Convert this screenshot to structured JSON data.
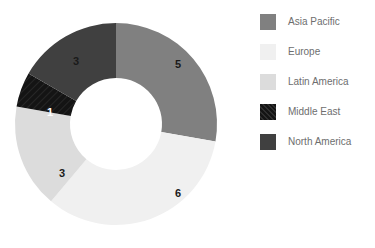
{
  "chart_data": {
    "type": "pie",
    "variant": "donut",
    "title": "",
    "xlabel": "",
    "ylabel": "",
    "total": 18,
    "start_angle_deg": 0,
    "direction": "clockwise",
    "inner_radius_ratio": 0.45,
    "legend_position": "right",
    "grid": false,
    "categories": [
      "Asia Pacific",
      "Europe",
      "Latin America",
      "Middle East",
      "North America"
    ],
    "values": [
      5,
      6,
      3,
      1,
      3
    ],
    "labels": [
      "5",
      "6",
      "3",
      "1",
      "3"
    ],
    "colors": [
      "#808080",
      "#f0f0f0",
      "#dcdcdc",
      "#141414",
      "#404040"
    ],
    "slices": [
      {
        "name": "Asia Pacific",
        "value": 5,
        "label": "5",
        "color": "#808080",
        "hatch": false,
        "label_color": "#1a1a1a",
        "start_deg": 0,
        "end_deg": 100,
        "label_x": 178,
        "label_y": 65
      },
      {
        "name": "Europe",
        "value": 6,
        "label": "6",
        "color": "#f0f0f0",
        "hatch": false,
        "label_color": "#1a1a1a",
        "start_deg": 100,
        "end_deg": 220,
        "label_x": 178,
        "label_y": 194
      },
      {
        "name": "Latin America",
        "value": 3,
        "label": "3",
        "color": "#dcdcdc",
        "hatch": false,
        "label_color": "#1a1a1a",
        "start_deg": 220,
        "end_deg": 280,
        "label_x": 62,
        "label_y": 174
      },
      {
        "name": "Middle East",
        "value": 1,
        "label": "1",
        "color": "#141414",
        "hatch": true,
        "label_color": "#ffffff",
        "start_deg": 280,
        "end_deg": 300,
        "label_x": 50,
        "label_y": 113
      },
      {
        "name": "North America",
        "value": 3,
        "label": "3",
        "color": "#404040",
        "hatch": false,
        "label_color": "#1a1a1a",
        "start_deg": 300,
        "end_deg": 360,
        "label_x": 76,
        "label_y": 62
      }
    ],
    "geometry": {
      "center_x": 116,
      "center_y": 124,
      "outer_radius": 101,
      "inner_radius": 46
    }
  },
  "legend": {
    "items": [
      {
        "label": "Asia Pacific",
        "color": "#808080",
        "hatch": false
      },
      {
        "label": "Europe",
        "color": "#f0f0f0",
        "hatch": false
      },
      {
        "label": "Latin America",
        "color": "#dcdcdc",
        "hatch": false
      },
      {
        "label": "Middle East",
        "color": "#141414",
        "hatch": true
      },
      {
        "label": "North America",
        "color": "#404040",
        "hatch": false
      }
    ]
  }
}
